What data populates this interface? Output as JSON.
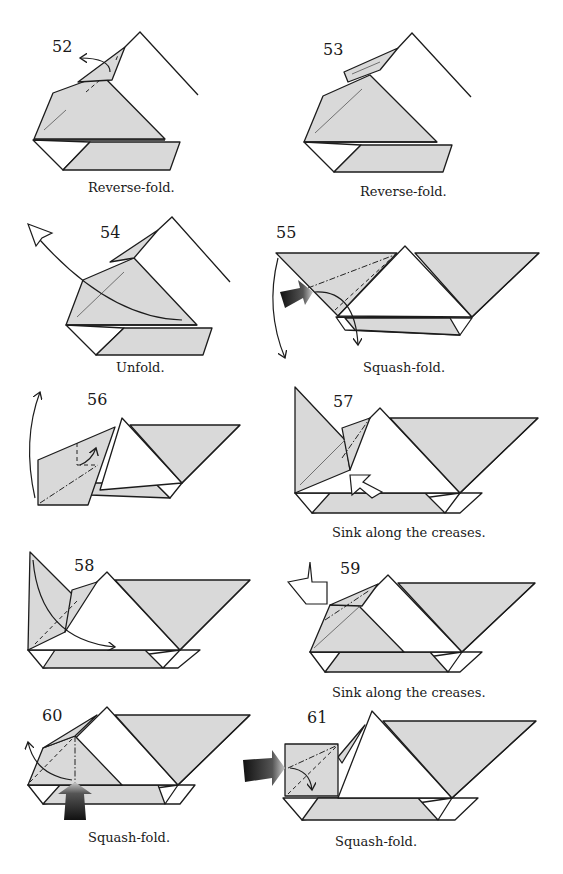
{
  "page": {
    "colors": {
      "paper": "#d9d9d9",
      "line": "#1c1c1c",
      "background": "#ffffff",
      "push_arrow": "#222222"
    }
  },
  "steps": [
    {
      "number": "52",
      "caption": "Reverse-fold.",
      "arrows": [
        "curved-arrow"
      ]
    },
    {
      "number": "53",
      "caption": "Reverse-fold.",
      "arrows": []
    },
    {
      "number": "54",
      "caption": "Unfold.",
      "arrows": [
        "hollow-unfold-arrow"
      ]
    },
    {
      "number": "55",
      "caption": "Squash-fold.",
      "arrows": [
        "push-arrow",
        "curved-arrow",
        "curved-arrow"
      ]
    },
    {
      "number": "56",
      "caption": "",
      "arrows": [
        "curved-arrow",
        "curved-arrow"
      ]
    },
    {
      "number": "57",
      "caption": "Sink along the creases.",
      "arrows": [
        "sink-arrow"
      ]
    },
    {
      "number": "58",
      "caption": "",
      "arrows": [
        "curved-arrow"
      ]
    },
    {
      "number": "59",
      "caption": "Sink along the creases.",
      "arrows": [
        "sink-arrow"
      ]
    },
    {
      "number": "60",
      "caption": "Squash-fold.",
      "arrows": [
        "push-arrow",
        "curved-arrow"
      ]
    },
    {
      "number": "61",
      "caption": "Squash-fold.",
      "arrows": [
        "push-arrow",
        "curved-arrow"
      ]
    }
  ]
}
